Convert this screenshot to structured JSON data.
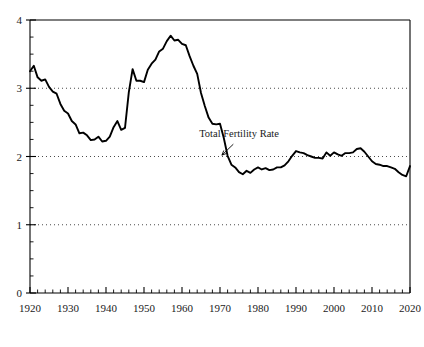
{
  "chart_data": {
    "type": "line",
    "title": "",
    "xlabel": "",
    "ylabel": "",
    "xlim": [
      1920,
      2020
    ],
    "ylim": [
      0,
      4
    ],
    "grid": true,
    "gridlines_y": [
      1,
      2,
      3
    ],
    "legend_position": "none",
    "x_ticks": [
      1920,
      1930,
      1940,
      1950,
      1960,
      1970,
      1980,
      1990,
      2000,
      2010,
      2020
    ],
    "x_tick_labels": [
      "1920",
      "1930",
      "1940",
      "1950",
      "1960",
      "1970",
      "1980",
      "1990",
      "2000",
      "2010",
      "2020"
    ],
    "x_minor_tick_step": 2,
    "y_ticks": [
      0,
      1,
      2,
      3,
      4
    ],
    "y_tick_labels": [
      "0",
      "1",
      "2",
      "3",
      "4"
    ],
    "y_minor_tick_step": 0.25,
    "annotations": [
      {
        "text": "Total Fertility Rate",
        "text_x": 1975,
        "text_y": 2.28,
        "arrow_from_x": 1973.5,
        "arrow_from_y": 2.18,
        "arrow_to_x": 1970.5,
        "arrow_to_y": 2.02
      }
    ],
    "series": [
      {
        "name": "Total Fertility Rate",
        "color": "#000000",
        "x": [
          1920,
          1921,
          1922,
          1923,
          1924,
          1925,
          1926,
          1927,
          1928,
          1929,
          1930,
          1931,
          1932,
          1933,
          1934,
          1935,
          1936,
          1937,
          1938,
          1939,
          1940,
          1941,
          1942,
          1943,
          1944,
          1945,
          1946,
          1947,
          1948,
          1949,
          1950,
          1951,
          1952,
          1953,
          1954,
          1955,
          1956,
          1957,
          1958,
          1959,
          1960,
          1961,
          1962,
          1963,
          1964,
          1965,
          1966,
          1967,
          1968,
          1969,
          1970,
          1971,
          1972,
          1973,
          1974,
          1975,
          1976,
          1977,
          1978,
          1979,
          1980,
          1981,
          1982,
          1983,
          1984,
          1985,
          1986,
          1987,
          1988,
          1989,
          1990,
          1991,
          1992,
          1993,
          1994,
          1995,
          1996,
          1997,
          1998,
          1999,
          2000,
          2001,
          2002,
          2003,
          2004,
          2005,
          2006,
          2007,
          2008,
          2009,
          2010,
          2011,
          2012,
          2013,
          2014,
          2015,
          2016,
          2017,
          2018,
          2019,
          2020
        ],
        "values": [
          3.25,
          3.33,
          3.16,
          3.11,
          3.13,
          3.02,
          2.95,
          2.92,
          2.77,
          2.67,
          2.63,
          2.52,
          2.47,
          2.34,
          2.35,
          2.31,
          2.24,
          2.25,
          2.29,
          2.22,
          2.23,
          2.29,
          2.43,
          2.52,
          2.39,
          2.42,
          2.94,
          3.28,
          3.11,
          3.11,
          3.09,
          3.27,
          3.36,
          3.42,
          3.54,
          3.58,
          3.69,
          3.77,
          3.7,
          3.71,
          3.65,
          3.63,
          3.47,
          3.33,
          3.21,
          2.93,
          2.74,
          2.57,
          2.48,
          2.47,
          2.48,
          2.27,
          2.01,
          1.88,
          1.84,
          1.77,
          1.74,
          1.79,
          1.76,
          1.81,
          1.84,
          1.81,
          1.83,
          1.8,
          1.81,
          1.84,
          1.84,
          1.87,
          1.93,
          2.01,
          2.08,
          2.06,
          2.05,
          2.02,
          2.0,
          1.98,
          1.98,
          1.97,
          2.06,
          2.01,
          2.06,
          2.03,
          2.01,
          2.05,
          2.05,
          2.06,
          2.11,
          2.12,
          2.07,
          2.0,
          1.93,
          1.89,
          1.88,
          1.86,
          1.86,
          1.84,
          1.82,
          1.77,
          1.73,
          1.71,
          1.86
        ]
      }
    ]
  }
}
